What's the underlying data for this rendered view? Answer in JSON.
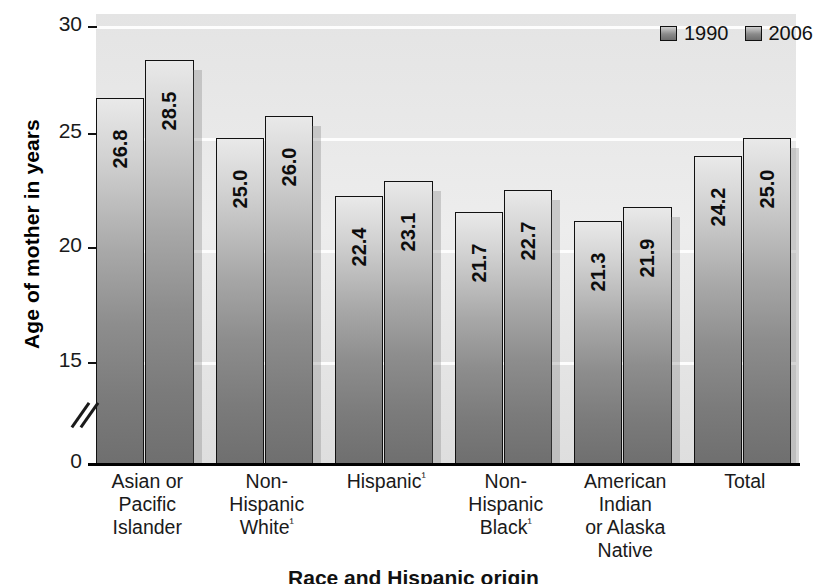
{
  "chart_data": {
    "type": "bar",
    "title": "",
    "bottom_title": "Race and Hispanic origin",
    "xlabel": "",
    "ylabel": "Age of mother in years",
    "ylim": [
      0,
      30
    ],
    "y_ticks": [
      0,
      15,
      20,
      25,
      30
    ],
    "y_tick_labels": [
      "0",
      "15",
      "20",
      "25",
      "30"
    ],
    "axis_break": true,
    "axis_break_between": [
      0,
      15
    ],
    "grid": true,
    "grid_color": "#fdfdfd",
    "legend_position": "top-right",
    "categories": [
      "Asian or Pacific Islander",
      "Non-Hispanic White",
      "Hispanic",
      "Non-Hispanic Black",
      "American Indian or Alaska Native",
      "Total"
    ],
    "category_label_lines": [
      [
        "Asian or",
        "Pacific",
        "Islander"
      ],
      [
        "Non-",
        "Hispanic",
        "White¹"
      ],
      [
        "Hispanic¹"
      ],
      [
        "Non-",
        "Hispanic",
        "Black¹"
      ],
      [
        "American",
        "Indian",
        "or Alaska",
        "Native"
      ],
      [
        "Total"
      ]
    ],
    "series": [
      {
        "name": "1990",
        "values": [
          26.8,
          25.0,
          22.4,
          21.7,
          21.3,
          24.2
        ]
      },
      {
        "name": "2006",
        "values": [
          28.5,
          26.0,
          23.1,
          22.7,
          21.9,
          25.0
        ]
      }
    ],
    "value_labels": [
      [
        "26.8",
        "28.5"
      ],
      [
        "25.0",
        "26.0"
      ],
      [
        "22.4",
        "23.1"
      ],
      [
        "21.7",
        "22.7"
      ],
      [
        "21.3",
        "21.9"
      ],
      [
        "24.2",
        "25.0"
      ]
    ]
  },
  "legend": {
    "items": [
      {
        "label": "1990",
        "color": "#8a8a8a"
      },
      {
        "label": "2006",
        "color": "#8a8a8a"
      }
    ]
  },
  "colors": {
    "plot_background": "#e8e8e8",
    "bar_top": "#e9e9e9",
    "bar_bottom": "#6f6f6f",
    "axis": "#000000",
    "gridline": "#fdfdfd",
    "text": "#1a1a1a"
  }
}
